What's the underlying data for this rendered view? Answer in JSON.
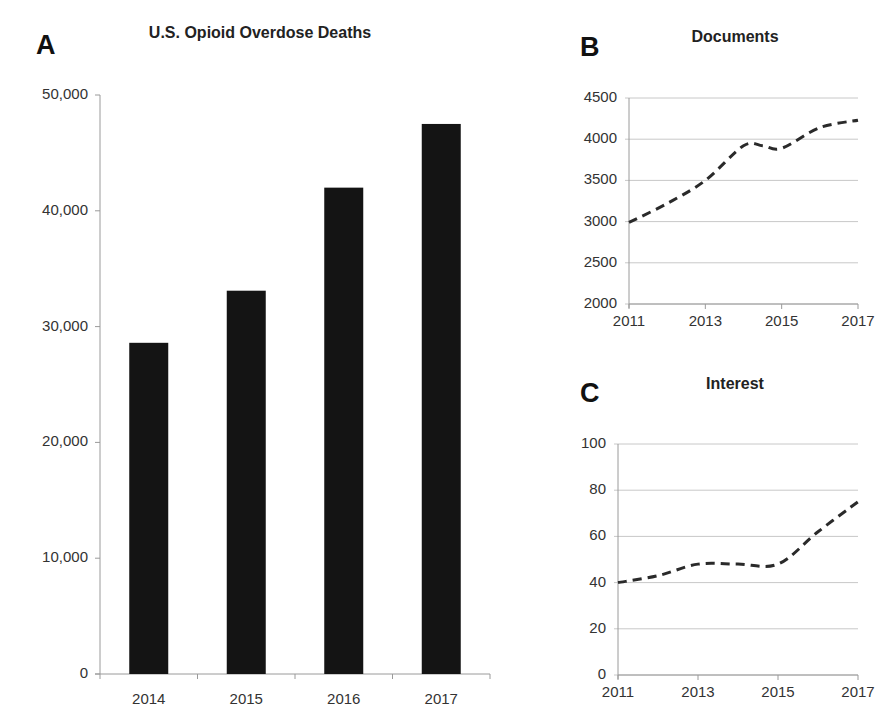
{
  "panels": {
    "A": {
      "letter": "A",
      "title": "U.S. Opioid Overdose Deaths",
      "y_ticks": [
        "50,000",
        "40,000",
        "30,000",
        "20,000",
        "10,000",
        "0"
      ],
      "x_ticks": [
        "2014",
        "2015",
        "2016",
        "2017"
      ]
    },
    "B": {
      "letter": "B",
      "title": "Documents",
      "y_ticks": [
        "4500",
        "4000",
        "3500",
        "3000",
        "2500",
        "2000"
      ],
      "x_ticks": [
        "2011",
        "2013",
        "2015",
        "2017"
      ]
    },
    "C": {
      "letter": "C",
      "title": "Interest",
      "y_ticks": [
        "100",
        "80",
        "60",
        "40",
        "20",
        "0"
      ],
      "x_ticks": [
        "2011",
        "2013",
        "2015",
        "2017"
      ]
    }
  },
  "colors": {
    "bar": "#141414",
    "line": "#2a2a2a",
    "grid": "#c8c8c8",
    "axis": "#9a9a9a"
  },
  "chart_data": [
    {
      "panel": "A",
      "type": "bar",
      "title": "U.S. Opioid Overdose Deaths",
      "xlabel": "",
      "ylabel": "",
      "categories": [
        "2014",
        "2015",
        "2016",
        "2017"
      ],
      "values": [
        28600,
        33100,
        42000,
        47500
      ],
      "ylim": [
        0,
        50000
      ],
      "y_ticks": [
        0,
        10000,
        20000,
        30000,
        40000,
        50000
      ],
      "grid": false,
      "legend": null
    },
    {
      "panel": "B",
      "type": "line",
      "title": "Documents",
      "xlabel": "",
      "ylabel": "",
      "x": [
        2011,
        2012,
        2013,
        2014,
        2014.5,
        2015,
        2016,
        2017
      ],
      "values": [
        2990,
        3220,
        3500,
        3920,
        3920,
        3890,
        4140,
        4230
      ],
      "ylim": [
        2000,
        4500
      ],
      "y_ticks": [
        2000,
        2500,
        3000,
        3500,
        4000,
        4500
      ],
      "x_ticks": [
        2011,
        2013,
        2015,
        2017
      ],
      "grid": true,
      "line_style": "dashed",
      "legend": null
    },
    {
      "panel": "C",
      "type": "line",
      "title": "Interest",
      "xlabel": "",
      "ylabel": "",
      "x": [
        2011,
        2012,
        2013,
        2014,
        2015,
        2016,
        2017
      ],
      "values": [
        40,
        43,
        48,
        48,
        48,
        62,
        75
      ],
      "ylim": [
        0,
        100
      ],
      "y_ticks": [
        0,
        20,
        40,
        60,
        80,
        100
      ],
      "x_ticks": [
        2011,
        2013,
        2015,
        2017
      ],
      "grid": true,
      "line_style": "dashed",
      "legend": null
    }
  ]
}
